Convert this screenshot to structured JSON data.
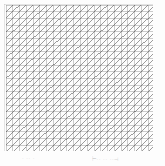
{
  "figure": {
    "type": "mesh-diagram",
    "title": "",
    "background_color": "#fdfdfd"
  },
  "mesh": {
    "name": "triangular-finite-element-mesh",
    "columns": 22,
    "rows": 22,
    "cell_width": 6.77,
    "cell_height": 6.68,
    "diagonal_direction": "bottom-left-to-top-right",
    "grid_line_color": "#9a9a9a",
    "diagonal_line_color": "#4a4a4a",
    "border_color": "#b5b5b5",
    "grid_line_width": 0.5,
    "diagonal_line_width": 0.55,
    "origin_x": 2,
    "origin_y": 1,
    "width": 149,
    "height": 147
  },
  "caption": {
    "left_mark": "· ·· ·",
    "right_mark": "⊢·· ·· ··⊣"
  }
}
